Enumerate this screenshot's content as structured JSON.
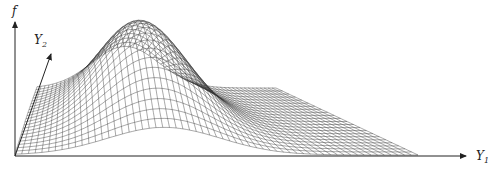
{
  "figure": {
    "type": "3d-surface-wireframe",
    "axes": {
      "vertical": {
        "label": "f",
        "sub": ""
      },
      "depth": {
        "label": "Y",
        "sub": "2"
      },
      "horizontal": {
        "label": "Y",
        "sub": "1"
      }
    },
    "colors": {
      "line": "#333333",
      "axis": "#222222",
      "background": "#ffffff"
    },
    "grid": {
      "rows": 22,
      "cols": 60,
      "origin": [
        15,
        155
      ],
      "u_vec": [
        403,
        0
      ],
      "v_vec": [
        22,
        -67
      ],
      "peak": {
        "u": 0.37,
        "v": 0.55,
        "height": 95,
        "su": 0.14,
        "sv": 0.35
      }
    }
  }
}
